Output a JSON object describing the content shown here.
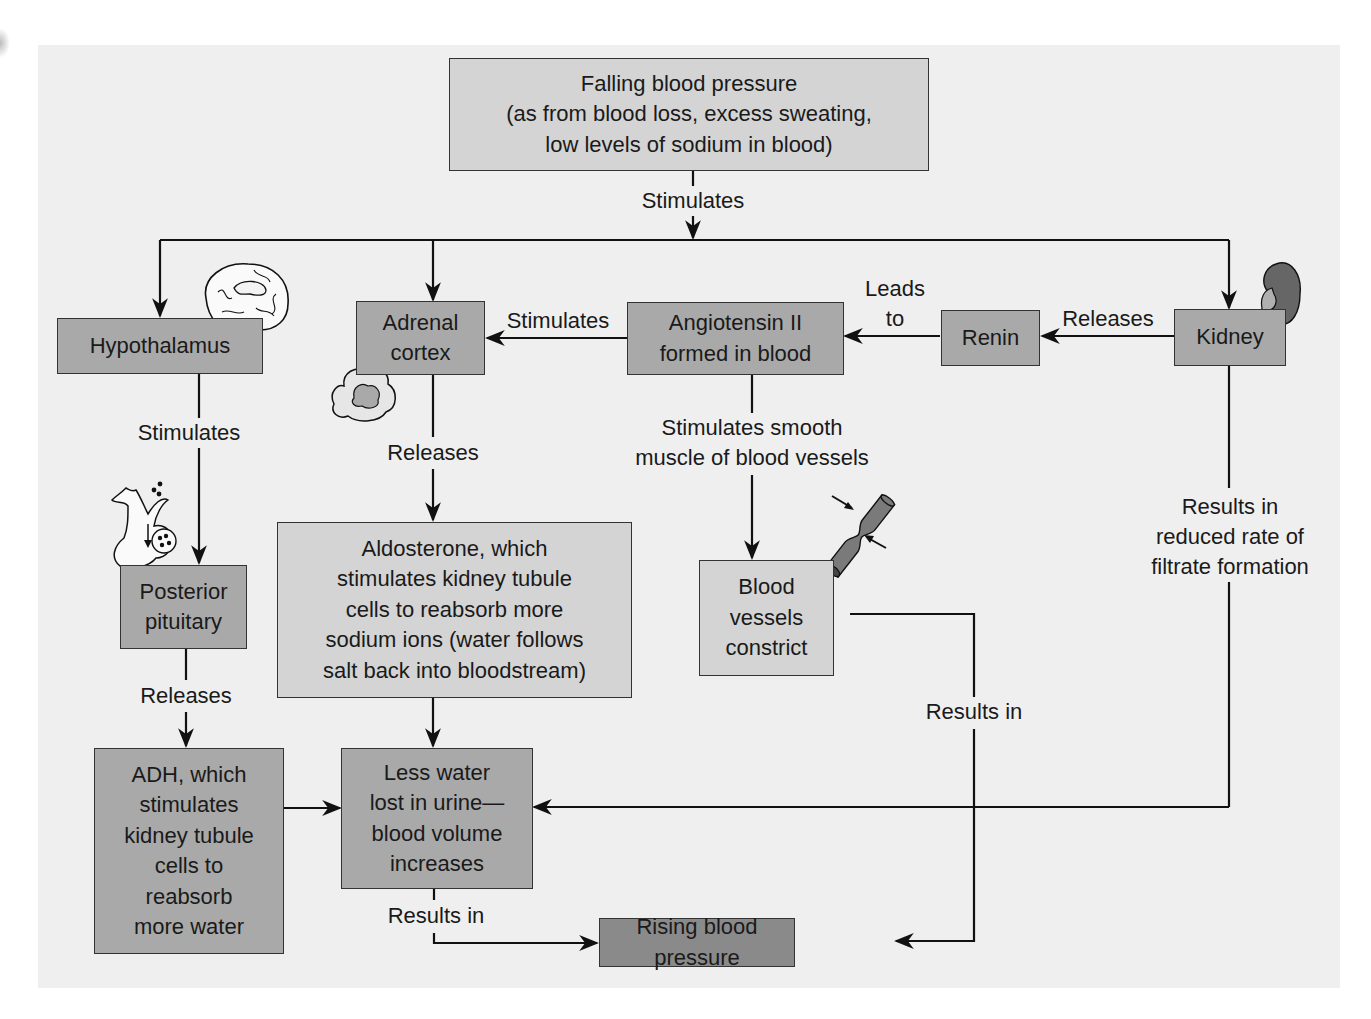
{
  "diagram": {
    "type": "flowchart",
    "colors": {
      "background_panel": "#efefef",
      "box_light": "#d4d4d4",
      "box_mid": "#a9a9a9",
      "box_dark": "#8a8a8a",
      "line": "#111111"
    },
    "nodes": {
      "falling_bp": "Falling blood pressure\n(as from blood loss, excess sweating,\nlow levels of sodium in blood)",
      "hypothalamus": "Hypothalamus",
      "adrenal_cortex": "Adrenal\ncortex",
      "angiotensin": "Angiotensin II\nformed in blood",
      "renin": "Renin",
      "kidney": "Kidney",
      "posterior_pituitary": "Posterior\npituitary",
      "aldosterone": "Aldosterone, which\nstimulates kidney tubule\ncells to reabsorb more\nsodium ions (water follows\nsalt back into bloodstream)",
      "blood_vessels": "Blood\nvessels\nconstrict",
      "adh": "ADH, which\nstimulates\nkidney tubule\ncells to\nreabsorb\nmore water",
      "less_water": "Less water\nlost in urine—\nblood volume\nincreases",
      "rising_bp": "Rising blood pressure"
    },
    "edge_labels": {
      "stimulates_top": "Stimulates",
      "leads_to": "Leads\nto",
      "releases_renin": "Releases",
      "stimulates_adrenal": "Stimulates",
      "stimulates_pituitary": "Stimulates",
      "releases_aldosterone": "Releases",
      "stimulates_smooth": "Stimulates smooth\nmuscle of blood vessels",
      "results_in_filtrate": "Results in\nreduced rate of\nfiltrate formation",
      "releases_adh": "Releases",
      "results_in_vessels": "Results in",
      "results_in_volume": "Results in"
    },
    "illustrations": [
      "brain-icon",
      "adrenal-gland-icon",
      "pituitary-icon",
      "kidney-icon",
      "constricted-vessel-icon"
    ]
  }
}
